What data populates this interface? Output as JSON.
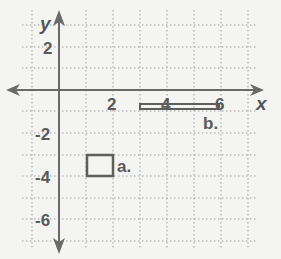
{
  "diagram": {
    "type": "coordinate-plane",
    "axes": {
      "x_label": "x",
      "y_label": "y"
    },
    "x_ticks": [
      {
        "value": 2,
        "label": "2"
      },
      {
        "value": 4,
        "label": "4"
      },
      {
        "value": 6,
        "label": "6"
      }
    ],
    "y_ticks": [
      {
        "value": 2,
        "label": "2"
      },
      {
        "value": -2,
        "label": "-2"
      },
      {
        "value": -4,
        "label": "-4"
      },
      {
        "value": -6,
        "label": "-6"
      }
    ],
    "grid": {
      "x_range": [
        -1,
        7
      ],
      "y_range": [
        -7,
        3
      ],
      "style": "dotted"
    },
    "shapes": [
      {
        "id": "a",
        "label": "a.",
        "kind": "rectangle",
        "x": [
          1,
          2
        ],
        "y": [
          -4,
          -3
        ]
      },
      {
        "id": "b",
        "label": "b.",
        "kind": "rectangle",
        "x": [
          3,
          6
        ],
        "y": [
          -0.85,
          -0.65
        ]
      }
    ],
    "colors": {
      "axis": "#6a6a6a",
      "grid": "#9a9a9a",
      "shape": "#5a5a5a",
      "background": "#f4f4f2"
    }
  }
}
